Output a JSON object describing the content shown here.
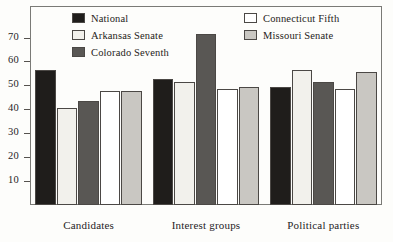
{
  "chart_data": {
    "type": "bar",
    "title": "",
    "subtitle": "",
    "xlabel": "",
    "ylabel": "",
    "categories": [
      "Candidates",
      "Interest groups",
      "Political parties"
    ],
    "series": [
      {
        "name": "National",
        "color": "#1f1d1b",
        "values": [
          57,
          53,
          50
        ]
      },
      {
        "name": "Arkansas Senate",
        "color": "#f2f1ec",
        "values": [
          41,
          52,
          57
        ]
      },
      {
        "name": "Colorado Seventh",
        "color": "#595754",
        "values": [
          44,
          72,
          52
        ]
      },
      {
        "name": "Connecticut Fifth",
        "color": "#ffffff",
        "values": [
          48,
          49,
          49
        ]
      },
      {
        "name": "Missouri Senate",
        "color": "#c9c7c2",
        "values": [
          48,
          50,
          56
        ]
      }
    ],
    "ylim": [
      0,
      75
    ],
    "yticks": [
      10,
      20,
      30,
      40,
      50,
      60,
      70
    ],
    "ytick_labels": [
      "10",
      "20",
      "30",
      "40",
      "50",
      "60",
      "70"
    ],
    "grid": false,
    "legend_position": "top-inside",
    "legend_columns": [
      [
        "National",
        "Arkansas Senate",
        "Colorado Seventh"
      ],
      [
        "Connecticut Fifth",
        "Missouri Senate"
      ]
    ]
  },
  "axis": {
    "y_tick_labels": [
      "70",
      "60",
      "50",
      "40",
      "30",
      "20",
      "10"
    ],
    "x_tick_labels": [
      "Candidates",
      "Interest groups",
      "Political parties"
    ]
  },
  "legend": {
    "items": [
      {
        "label": "National"
      },
      {
        "label": "Arkansas Senate"
      },
      {
        "label": "Colorado Seventh"
      },
      {
        "label": "Connecticut Fifth"
      },
      {
        "label": "Missouri Senate"
      }
    ]
  }
}
